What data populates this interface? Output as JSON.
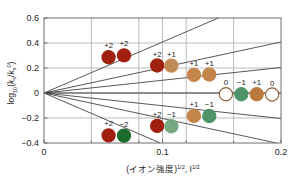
{
  "chart_data": {
    "type": "scatter",
    "title": "",
    "xlabel": "(イオン強度)1/2, I1/2",
    "xlabel_main": "(イオン強度)",
    "xlabel_exp1": "1/2",
    "xlabel_mid": ", I",
    "xlabel_exp2": "1/2",
    "ylabel": "log10(ks/ks0)",
    "ylabel_parts": {
      "log": "log",
      "base": "10",
      "open": "(",
      "k1": "k",
      "k1sub": "s",
      "slash": "/",
      "k2": "k",
      "k2sub": "s",
      "k2sup": "0",
      "close": ")"
    },
    "xlim": [
      0,
      0.2
    ],
    "ylim": [
      -0.4,
      0.6
    ],
    "xticks": [
      0,
      0.1,
      0.2
    ],
    "xtick_labels": [
      "0",
      "0.1",
      "0.2"
    ],
    "yticks": [
      -0.4,
      -0.2,
      0,
      0.2,
      0.4,
      0.6
    ],
    "ytick_labels": [
      "-0.4",
      "-0.2",
      "0",
      "0.2",
      "0.4",
      "0.6"
    ],
    "x_minor_gridlines": [
      0.04,
      0.08,
      0.12,
      0.16
    ],
    "grid": true,
    "legend": "none",
    "theory_lines": [
      {
        "name": "zAzB=+4",
        "slope": 4.08,
        "label": "+2 x +2"
      },
      {
        "name": "zAzB=+2",
        "slope": 2.04,
        "label": "+2 x +1"
      },
      {
        "name": "zAzB=+1",
        "slope": 1.02,
        "label": "+1 x +1"
      },
      {
        "name": "zAzB=0",
        "slope": 0.0,
        "label": "0 x n"
      },
      {
        "name": "zAzB=-1",
        "slope": -1.02,
        "label": "+1 x -1"
      },
      {
        "name": "zAzB=-2",
        "slope": -2.04,
        "label": "+2 x -1"
      },
      {
        "name": "zAzB=-4",
        "slope": -4.08,
        "label": "+2 x -2"
      }
    ],
    "series": [
      {
        "name": "+2 x +2",
        "charge_labels": [
          "+2",
          "+2"
        ],
        "color": "#a0200f",
        "points": [
          {
            "x": 0.0545,
            "y": 0.286,
            "label": "+2",
            "color": "#a0200f",
            "filled": true
          },
          {
            "x": 0.0675,
            "y": 0.301,
            "label": "+2",
            "color": "#a0200f",
            "filled": true
          }
        ]
      },
      {
        "name": "+2 x +1",
        "charge_labels": [
          "+2",
          "+1"
        ],
        "color": "#a0200f",
        "points": [
          {
            "x": 0.0955,
            "y": 0.22,
            "label": "+2",
            "color": "#a0200f",
            "filled": true
          },
          {
            "x": 0.1075,
            "y": 0.219,
            "label": "+1",
            "color": "#c08a54",
            "filled": true
          }
        ]
      },
      {
        "name": "+1 x +1",
        "charge_labels": [
          "+1",
          "+1"
        ],
        "color": "#c08a54",
        "points": [
          {
            "x": 0.1265,
            "y": 0.145,
            "label": "+1",
            "color": "#c4854a",
            "filled": true
          },
          {
            "x": 0.1395,
            "y": 0.148,
            "label": "+1",
            "color": "#c4854a",
            "filled": true
          }
        ]
      },
      {
        "name": "neutral group",
        "charge_labels": [
          "0",
          "-1",
          "+1",
          "0"
        ],
        "color": "#ffffff",
        "points": [
          {
            "x": 0.1535,
            "y": -0.01,
            "label": "0",
            "color": "#ffffff",
            "filled": false
          },
          {
            "x": 0.1665,
            "y": -0.01,
            "label": "-1",
            "color": "#4f9468",
            "filled": true
          },
          {
            "x": 0.1795,
            "y": -0.01,
            "label": "+1",
            "color": "#bc7a3e",
            "filled": true
          },
          {
            "x": 0.1925,
            "y": -0.012,
            "label": "0",
            "color": "#ffffff",
            "filled": false
          }
        ]
      },
      {
        "name": "+1 x -1",
        "charge_labels": [
          "+1",
          "-1"
        ],
        "color": "#c4854a",
        "points": [
          {
            "x": 0.1265,
            "y": -0.183,
            "label": "+1",
            "color": "#c4854a",
            "filled": true
          },
          {
            "x": 0.1395,
            "y": -0.184,
            "label": "-1",
            "color": "#4f9468",
            "filled": true
          }
        ]
      },
      {
        "name": "+2 x -1",
        "charge_labels": [
          "+2",
          "-1"
        ],
        "color": "#a0200f",
        "points": [
          {
            "x": 0.0955,
            "y": -0.263,
            "label": "+2",
            "color": "#a0200f",
            "filled": true
          },
          {
            "x": 0.1075,
            "y": -0.266,
            "label": "-1",
            "color": "#76a882",
            "filled": true
          }
        ]
      },
      {
        "name": "+2 x -2",
        "charge_labels": [
          "+2",
          "-2"
        ],
        "color": "#a0200f",
        "points": [
          {
            "x": 0.0545,
            "y": -0.339,
            "label": "+2",
            "color": "#a0200f",
            "filled": true
          },
          {
            "x": 0.0675,
            "y": -0.341,
            "label": "-2",
            "color": "#1d6b2c",
            "filled": true
          }
        ]
      }
    ],
    "colors": {
      "dark_red": "#a0200f",
      "tan": "#c4854a",
      "green": "#4f9468",
      "light_green": "#76a882",
      "dark_green": "#1d6b2c",
      "open_rim": "#8a5a2a",
      "grid": "#b4b4b4",
      "frame": "#6e6e6e",
      "line": "#3a3a3a",
      "text": "#1a1a1a",
      "background": "#ffffff"
    }
  }
}
